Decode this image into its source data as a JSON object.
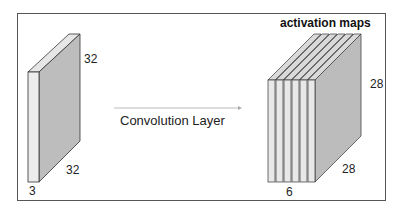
{
  "diagram": {
    "title": "activation maps",
    "input_volume": {
      "depth": "3",
      "height": "32",
      "width": "32"
    },
    "operation_label": "Convolution Layer",
    "output_volume": {
      "depth": "6",
      "height": "28",
      "width": "28"
    },
    "colors": {
      "front_face": "#e8e8e8",
      "side_face": "#bcbcbc",
      "top_face": "#d9d9d9",
      "stroke": "#333333",
      "arrow": "#aaaaaa"
    }
  }
}
